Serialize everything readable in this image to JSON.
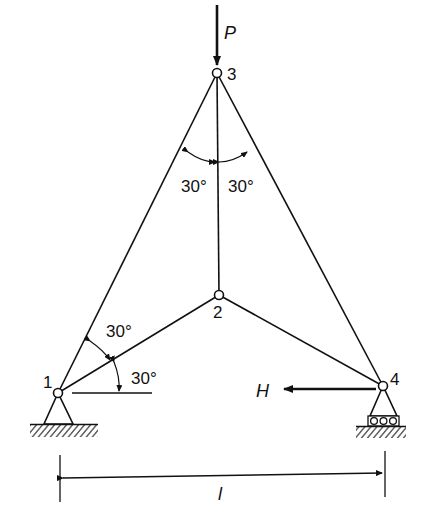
{
  "diagram": {
    "type": "truss",
    "nodes": [
      {
        "id": "1",
        "label": "1",
        "x": 58,
        "y": 393,
        "support": "pin"
      },
      {
        "id": "2",
        "label": "2",
        "x": 219,
        "y": 295,
        "support": "none"
      },
      {
        "id": "3",
        "label": "3",
        "x": 217,
        "y": 73,
        "support": "none"
      },
      {
        "id": "4",
        "label": "4",
        "x": 383,
        "y": 386,
        "support": "roller"
      }
    ],
    "members": [
      {
        "from": "1",
        "to": "3"
      },
      {
        "from": "1",
        "to": "2"
      },
      {
        "from": "2",
        "to": "3"
      },
      {
        "from": "2",
        "to": "4"
      },
      {
        "from": "3",
        "to": "4"
      }
    ],
    "loads": {
      "vertical": {
        "label": "P",
        "node": "3",
        "direction": "down"
      },
      "horizontal": {
        "label": "H",
        "node": "4",
        "direction": "left"
      }
    },
    "angles": {
      "top_left": "30°",
      "top_right": "30°",
      "node1_upper": "30°",
      "node1_lower": "30°"
    },
    "dimension": {
      "label": "l",
      "from": "1",
      "to": "4"
    },
    "colors": {
      "ink": "#111111",
      "background": "#ffffff"
    }
  }
}
